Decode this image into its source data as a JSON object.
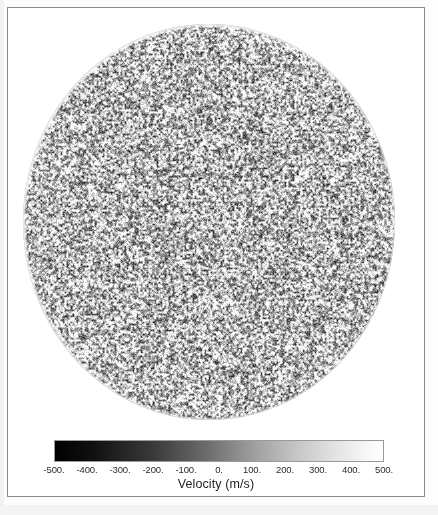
{
  "figure": {
    "kind": "solar-doppler-velocity-full-disk",
    "frame_border_color": "#8a8a8a",
    "background_color": "#ffffff"
  },
  "disk": {
    "name": "solar-disk",
    "description": "Full-disk solar Doppler velocity map with fine granulation speckle",
    "center_x": 207,
    "center_y": 221,
    "radius_x": 186,
    "radius_y": 198,
    "mean_gray": "#b4b4b4"
  },
  "colorbar": {
    "title": "Velocity (m/s)",
    "units": "m/s",
    "min": -500,
    "max": 500,
    "low_color": "#000000",
    "high_color": "#ffffff",
    "ticks": [
      {
        "value": -500,
        "label": "-500."
      },
      {
        "value": -400,
        "label": "-400."
      },
      {
        "value": -300,
        "label": "-300."
      },
      {
        "value": -200,
        "label": "-200."
      },
      {
        "value": -100,
        "label": "-100."
      },
      {
        "value": 0,
        "label": "0."
      },
      {
        "value": 100,
        "label": "100."
      },
      {
        "value": 200,
        "label": "200."
      },
      {
        "value": 300,
        "label": "300."
      },
      {
        "value": 400,
        "label": "400."
      },
      {
        "value": 500,
        "label": "500."
      }
    ]
  },
  "chart_data": {
    "type": "heatmap",
    "title": "",
    "subtitle": "",
    "xlabel": "",
    "ylabel": "",
    "colorbar_label": "Velocity (m/s)",
    "colormap": "grayscale",
    "clim": [
      -500,
      500
    ],
    "tick_labels": [
      "-500.",
      "-400.",
      "-300.",
      "-200.",
      "-100.",
      "0.",
      "100.",
      "200.",
      "300.",
      "400.",
      "500."
    ],
    "tick_values": [
      -500,
      -400,
      -300,
      -200,
      -100,
      0,
      100,
      200,
      300,
      400,
      500
    ],
    "grid": false,
    "legend_position": "bottom",
    "geometry": {
      "shape": "circle",
      "center": [
        207,
        221
      ],
      "radius": 190
    },
    "field_description": "Spatially uncorrelated high-frequency speckle of line-of-sight velocity across the solar disk, values spanning approximately -500 to 500 m/s with a mid-gray mean near 0 m/s."
  }
}
